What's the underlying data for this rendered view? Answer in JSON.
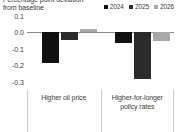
{
  "chart_data": {
    "type": "bar",
    "title": "Percentage point deviation from baseline",
    "title_lines": [
      "Percentage point deviation",
      "from baseline"
    ],
    "xlabel": "",
    "ylabel": "",
    "ylim": [
      -0.35,
      0.1
    ],
    "yticks": [
      0.1,
      0.0,
      -0.1,
      -0.2,
      -0.3
    ],
    "ytick_labels": [
      "0.1",
      "0.0",
      "-0.1",
      "-0.2",
      "-0.3"
    ],
    "grid": false,
    "zero_line": true,
    "legend_position": "top-right",
    "categories": [
      "Higher oil price",
      "Higher-for-longer policy rates"
    ],
    "category_lines": [
      [
        "Higher oil price"
      ],
      [
        "Higher-for-longer",
        "policy rates"
      ]
    ],
    "series": [
      {
        "name": "2024",
        "color": "#111111",
        "values": [
          -0.185,
          -0.065
        ]
      },
      {
        "name": "2025",
        "color": "#2b2b2b",
        "values": [
          -0.045,
          -0.285
        ]
      },
      {
        "name": "2026",
        "color": "#a8a8a8",
        "values": [
          0.018,
          -0.055
        ]
      }
    ]
  },
  "legend": {
    "items": [
      {
        "label": "2024",
        "color": "#111111"
      },
      {
        "label": "2025",
        "color": "#2b2b2b"
      },
      {
        "label": "2026",
        "color": "#a8a8a8"
      }
    ]
  }
}
